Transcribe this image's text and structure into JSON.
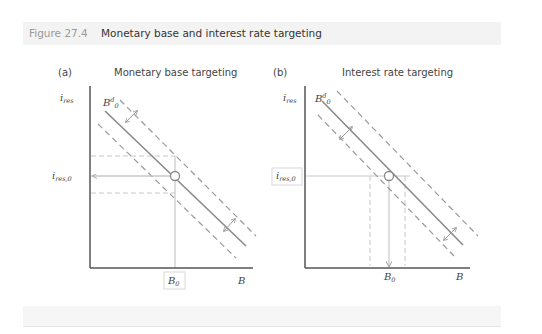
{
  "figure": {
    "label": "Figure 27.4",
    "title": "Monetary base and interest rate targeting"
  },
  "panels": [
    {
      "id": "a",
      "letter": "(a)",
      "title": "Monetary base targeting",
      "y_axis_label": "i",
      "y_axis_sub": "res",
      "x_axis_label": "B",
      "curve_label": "B",
      "curve_sup": "d",
      "curve_sub": "0",
      "eq_y_label": "i",
      "eq_y_sub": "res,0",
      "eq_x_label": "B",
      "eq_x_sub": "0"
    },
    {
      "id": "b",
      "letter": "(b)",
      "title": "Interest rate targeting",
      "y_axis_label": "i",
      "y_axis_sub": "res",
      "x_axis_label": "B",
      "curve_label": "B",
      "curve_sup": "d",
      "curve_sub": "0",
      "eq_y_label": "i",
      "eq_y_sub": "res,0",
      "eq_x_label": "B",
      "eq_x_sub": "0"
    }
  ],
  "colors": {
    "axis": "#555555",
    "demand_line": "#8a8a8a",
    "dashed": "#9a9a9a",
    "guide": "#c8c8c8",
    "header_bg": "#f3f3f3",
    "figure_label": "#9a9a9a"
  }
}
